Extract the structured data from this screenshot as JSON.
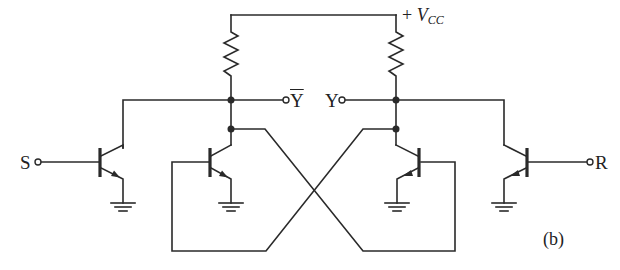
{
  "diagram": {
    "type": "circuit-schematic",
    "labels": {
      "supply_plus": "+",
      "supply_v": "V",
      "supply_sub": "CC",
      "set_input": "S",
      "reset_input": "R",
      "output_q_bar": "Y",
      "output_q": "Y",
      "figure_tag": "(b)"
    },
    "components": {
      "resistors": 2,
      "transistors": 4,
      "grounds": 4,
      "terminals": [
        "S",
        "Ȳ",
        "Y",
        "R"
      ]
    },
    "colors": {
      "line": "#2a2a2a",
      "background": "#ffffff"
    }
  }
}
